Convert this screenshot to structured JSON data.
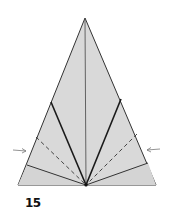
{
  "diagram": {
    "step_number": "15",
    "colors": {
      "paper_fill": "#d9d9d9",
      "outline": "#333333",
      "fold_line": "#1a1a1a",
      "arrow": "#777777"
    },
    "outer_triangle": {
      "apex": [
        85,
        18
      ],
      "base_left": [
        18,
        185
      ],
      "base_right": [
        156,
        185
      ]
    },
    "convergence_point": [
      86,
      185
    ],
    "center_crease": {
      "from": [
        85,
        20
      ],
      "to": [
        86,
        185
      ]
    },
    "inner_flap_corners": {
      "left": [
        51,
        102
      ],
      "right": [
        121,
        99
      ]
    },
    "lower_flap_corners": {
      "left": [
        27,
        165
      ],
      "right": [
        148,
        163
      ]
    },
    "valley_fold_lines": [
      {
        "from": [
          36,
          137
        ],
        "to": [
          86,
          185
        ],
        "style": "dashed"
      },
      {
        "from": [
          137,
          134
        ],
        "to": [
          86,
          185
        ],
        "style": "dashed"
      }
    ],
    "arrows": [
      {
        "name": "left-push-arrow",
        "from": [
          13,
          150
        ],
        "to": [
          27,
          151
        ],
        "direction": "right"
      },
      {
        "name": "right-push-arrow",
        "from": [
          160,
          149
        ],
        "to": [
          146,
          150
        ],
        "direction": "left"
      }
    ]
  }
}
